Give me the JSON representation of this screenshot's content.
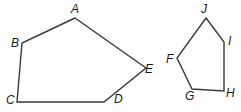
{
  "figures": [
    {
      "name": "pentagon-ABCDE",
      "vertices": [
        {
          "label": "A",
          "x": 75,
          "y": 18,
          "lx": 71,
          "ly": 13
        },
        {
          "label": "B",
          "x": 22,
          "y": 43,
          "lx": 11,
          "ly": 47
        },
        {
          "label": "C",
          "x": 17,
          "y": 102,
          "lx": 6,
          "ly": 104
        },
        {
          "label": "D",
          "x": 104,
          "y": 102,
          "lx": 114,
          "ly": 103
        },
        {
          "label": "E",
          "x": 146,
          "y": 68,
          "lx": 145,
          "ly": 73
        }
      ]
    },
    {
      "name": "pentagon-FGHIJ",
      "vertices": [
        {
          "label": "J",
          "x": 206,
          "y": 18,
          "lx": 201,
          "ly": 13
        },
        {
          "label": "I",
          "x": 224,
          "y": 42,
          "lx": 228,
          "ly": 45
        },
        {
          "label": "H",
          "x": 224,
          "y": 91,
          "lx": 226,
          "ly": 97
        },
        {
          "label": "G",
          "x": 192,
          "y": 89,
          "lx": 185,
          "ly": 100
        },
        {
          "label": "F",
          "x": 177,
          "y": 58,
          "lx": 166,
          "ly": 63
        }
      ]
    }
  ]
}
